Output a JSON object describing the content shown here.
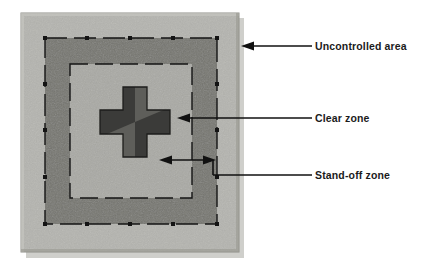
{
  "figure": {
    "type": "site-security-zone-diagram"
  },
  "callouts": [
    {
      "id": "uncontrolled",
      "label": "Uncontrolled area",
      "arrow": "single-head-left",
      "points_to": "outermost area of the site plate"
    },
    {
      "id": "clear",
      "label": "Clear zone",
      "arrow": "single-head-left",
      "points_to": "light band inside the inner dashed boundary"
    },
    {
      "id": "standoff",
      "label": "Stand-off zone",
      "arrow": "double-head",
      "points_to": "distance between building edge and inner dashed boundary"
    }
  ],
  "zones": {
    "plate_label": "site plate",
    "uncontrolled_label": "Uncontrolled area",
    "controlled_band_label": "controlled perimeter band",
    "clear_zone_label": "Clear zone",
    "standoff_label": "Stand-off zone",
    "building_label": "cross-shaped building"
  },
  "colors": {
    "page_background": "#ffffff",
    "plate_fill": "#b4b4af",
    "plate_edge": "#9a9a94",
    "controlled_band_fill": "#75756f",
    "clear_zone_fill": "#a9a9a4",
    "building_dark": "#3b3b39",
    "building_medium": "#5e5e5a",
    "line_color": "#111111",
    "label_color": "#1b1b1b",
    "shadow": "#cfcfcb"
  }
}
